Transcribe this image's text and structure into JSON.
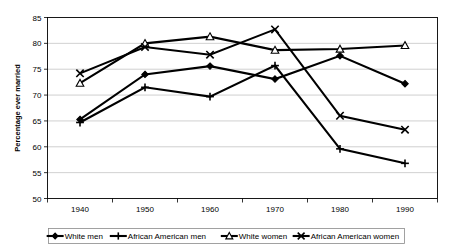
{
  "chart_data": {
    "type": "line",
    "title": "",
    "xlabel": "",
    "ylabel": "Percentage ever married",
    "categories": [
      "1940",
      "1950",
      "1960",
      "1970",
      "1980",
      "1990"
    ],
    "x": [
      1940,
      1950,
      1960,
      1970,
      1980,
      1990
    ],
    "ylim": [
      50,
      85
    ],
    "yticks": [
      50,
      55,
      60,
      65,
      70,
      75,
      80,
      85
    ],
    "ytick_labels": [
      "50",
      "55",
      "60",
      "65",
      "70",
      "75",
      "80",
      "85"
    ],
    "grid": "horizontal",
    "legend_position": "bottom",
    "series": [
      {
        "name": "White men",
        "marker": "diamond",
        "marker_style": "solid",
        "values": [
          65.3,
          74.0,
          75.6,
          73.1,
          77.6,
          72.2
        ]
      },
      {
        "name": "African American men",
        "marker": "plus",
        "marker_style": "stroke",
        "values": [
          64.7,
          71.5,
          69.7,
          75.7,
          59.6,
          56.8
        ]
      },
      {
        "name": "White women",
        "marker": "triangle",
        "marker_style": "open",
        "values": [
          72.3,
          80.0,
          81.3,
          78.7,
          78.9,
          79.6
        ]
      },
      {
        "name": "African American women",
        "marker": "x-cross",
        "marker_style": "stroke",
        "values": [
          74.2,
          79.3,
          77.8,
          82.7,
          66.0,
          63.3
        ]
      }
    ],
    "colors": {
      "line": "#000000",
      "grid": "#b0b0b0",
      "frame": "#000000",
      "background": "#ffffff"
    }
  }
}
